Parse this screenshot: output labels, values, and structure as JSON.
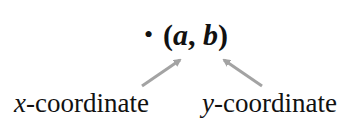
{
  "diagram": {
    "point": {
      "bullet": "•",
      "open": "(",
      "a": "a",
      "sep": ", ",
      "b": "b",
      "close": ")"
    },
    "labels": [
      {
        "var": "x",
        "text": "-coordinate",
        "points_to": "a"
      },
      {
        "var": "y",
        "text": "-coordinate",
        "points_to": "b"
      }
    ],
    "arrow_color": "#a3a3a3"
  }
}
